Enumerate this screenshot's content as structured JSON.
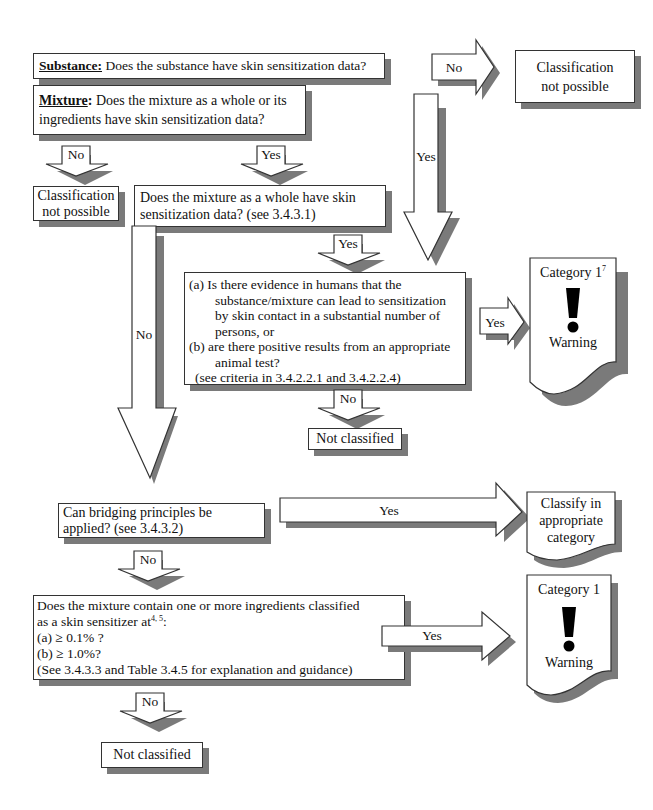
{
  "substance": {
    "label": "Substance:",
    "question": " Does the substance have skin sensitization data?"
  },
  "arrow_substance_no": "No",
  "class_not_possible_top": [
    "Classification",
    "not possible"
  ],
  "mixture": {
    "label": "Mixture",
    "colon": ":",
    "question": "  Does the mixture as a whole or its ingredients have skin sensitization data?"
  },
  "arrow_mixture_no": "No",
  "arrow_mixture_yes": "Yes",
  "arrow_substance_yes": "Yes",
  "class_not_possible_left": [
    "Classification",
    "not possible"
  ],
  "mixture_whole": "Does the mixture as a whole have skin sensitization data? (see 3.4.3.1)",
  "arrow_whole_yes": "Yes",
  "arrow_whole_no": "No",
  "evidence_box": {
    "a_prefix": "(a) Is there evidence in humans that the",
    "a_rest": "substance/mixture can lead to sensitization by skin contact in a substantial number of persons, or",
    "b_prefix": "(b) are there positive results from an appropriate",
    "b_rest": "animal test?",
    "criteria": "(see criteria in 3.4.2.2.1 and 3.4.2.2.4)"
  },
  "arrow_evidence_yes": "Yes",
  "arrow_evidence_no": "No",
  "category1_top": {
    "title": "Category 1",
    "sup": "7",
    "symbol": "!",
    "signal": "Warning"
  },
  "not_classified_mid": "Not classified",
  "bridging": "Can bridging principles be applied? (see 3.4.3.2)",
  "arrow_bridging_yes": "Yes",
  "classify_doc": [
    "Classify in",
    "appropriate",
    "category"
  ],
  "arrow_bridging_no": "No",
  "ingredients_box": {
    "line1": "Does the mixture contain one or more ingredients classified",
    "line2_prefix": "as a skin sensitizer at",
    "line2_sup": "4, 5",
    "line2_suffix": ":",
    "line3": "(a)  ≥  0.1% ?",
    "line4": "(b)  ≥  1.0%?",
    "line5": "(See 3.4.3.3 and Table 3.4.5 for explanation and guidance)"
  },
  "arrow_ingredients_yes": "Yes",
  "category1_bottom": {
    "title": "Category 1",
    "symbol": "!",
    "signal": "Warning"
  },
  "arrow_ingredients_no": "No",
  "not_classified_bottom": "Not classified"
}
